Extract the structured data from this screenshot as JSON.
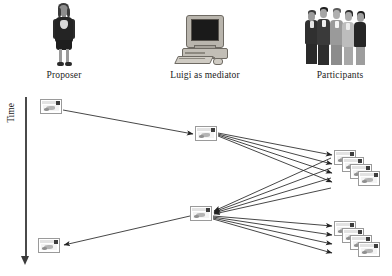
{
  "diagram": {
    "background_color": "#ffffff",
    "line_color": "#2b2b2b",
    "actors": [
      {
        "id": "proposer",
        "label": "Proposer",
        "icon": "businesswoman-figure-icon",
        "column_x": 64
      },
      {
        "id": "mediator",
        "label": "Luigi as mediator",
        "icon": "desktop-computer-icon",
        "column_x": 203
      },
      {
        "id": "participants",
        "label": "Participants",
        "icon": "people-group-icon",
        "column_x": 340
      }
    ],
    "time_axis": {
      "label": "Time",
      "direction": "downward",
      "arrow_icon": "down-arrow-icon"
    },
    "message_icon": "message-window-icon",
    "messages": [
      {
        "id": "m1",
        "owner": "proposer",
        "x": 40,
        "y": 99,
        "role": "initial-proposal"
      },
      {
        "id": "m2",
        "owner": "mediator",
        "x": 195,
        "y": 128,
        "role": "mediator-broadcast-1"
      },
      {
        "id": "m3",
        "owner": "mediator",
        "x": 190,
        "y": 206,
        "role": "mediator-broadcast-2"
      },
      {
        "id": "m4",
        "owner": "proposer",
        "x": 38,
        "y": 238,
        "role": "final-result"
      }
    ],
    "message_stacks": [
      {
        "id": "s1",
        "owner": "participants",
        "x": 335,
        "y": 152,
        "count": 4,
        "role": "participant-replies-1"
      },
      {
        "id": "s2",
        "owner": "participants",
        "x": 335,
        "y": 223,
        "count": 4,
        "role": "participant-replies-2"
      }
    ],
    "edges": [
      {
        "from": "m1",
        "to": "m2",
        "kind": "single",
        "label": ""
      },
      {
        "from": "m2",
        "to": "s1",
        "kind": "fan-out",
        "count": 4
      },
      {
        "from": "s1",
        "to": "m3",
        "kind": "fan-in",
        "count": 4
      },
      {
        "from": "m3",
        "to": "s2",
        "kind": "fan-out",
        "count": 4
      },
      {
        "from": "s2",
        "to": "m4",
        "kind": "single",
        "label": ""
      }
    ]
  }
}
